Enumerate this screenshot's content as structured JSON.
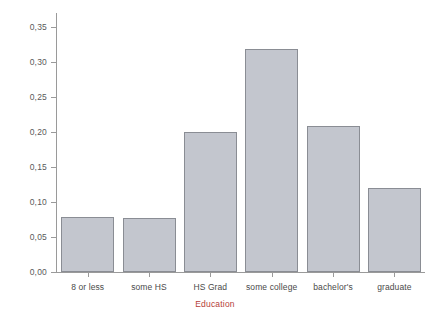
{
  "chart_data": {
    "type": "bar",
    "title": "",
    "subtitle": "",
    "xlabel": "Education",
    "ylabel": "",
    "categories": [
      "8 or less",
      "some HS",
      "HS Grad",
      "some college",
      "bachelor's",
      "graduate"
    ],
    "values": [
      0.079,
      0.077,
      0.2,
      0.318,
      0.208,
      0.12
    ],
    "ylim": [
      0.0,
      0.37
    ],
    "ytick_values": [
      0.0,
      0.05,
      0.1,
      0.15,
      0.2,
      0.25,
      0.3,
      0.35
    ],
    "ytick_labels": [
      "0,00",
      "0,05",
      "0,10",
      "0,15",
      "0,20",
      "0,25",
      "0,30",
      "0,35"
    ],
    "decimal_separator": ",",
    "grid": false,
    "legend": null,
    "legend_position": "none",
    "series": [
      {
        "name": "Education",
        "values": [
          0.079,
          0.077,
          0.2,
          0.318,
          0.208,
          0.12
        ]
      }
    ],
    "colors": {
      "bar_fill": "#c3c6ce",
      "bar_border": "#8a8d94",
      "axis_line": "#9a9a9a",
      "tick_label": "#5a5a5a",
      "category_label": "#4a4a4a",
      "xlabel_color": "#b5403a",
      "background": "#ffffff"
    }
  }
}
